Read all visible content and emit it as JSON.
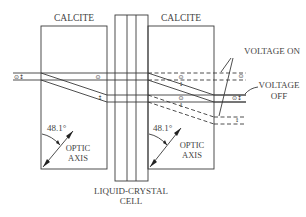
{
  "diagram": {
    "labels": {
      "left_crystal": "CALCITE",
      "right_crystal": "CALCITE",
      "voltage_on": "VOLTAGE ON",
      "voltage_off_line1": "VOLTAGE",
      "voltage_off_line2": "OFF",
      "angle_left": "48.1°",
      "angle_right": "48.1°",
      "optic_axis_left_1": "OPTIC",
      "optic_axis_left_2": "AXIS",
      "optic_axis_right_1": "OPTIC",
      "optic_axis_right_2": "AXIS",
      "cell_line1": "LIQUID-CRYSTAL",
      "cell_line2": "CELL"
    },
    "polarization_symbols": {
      "input": "⊙↕",
      "circle_dot": "⊙",
      "vertical": "↕",
      "combined": "⊙↕"
    },
    "components": [
      {
        "name": "calcite-left",
        "type": "crystal"
      },
      {
        "name": "liquid-crystal-cell",
        "type": "cell"
      },
      {
        "name": "calcite-right",
        "type": "crystal"
      }
    ],
    "colors": {
      "line": "#3a3a3a",
      "text": "#444444",
      "background": "#ffffff"
    }
  }
}
